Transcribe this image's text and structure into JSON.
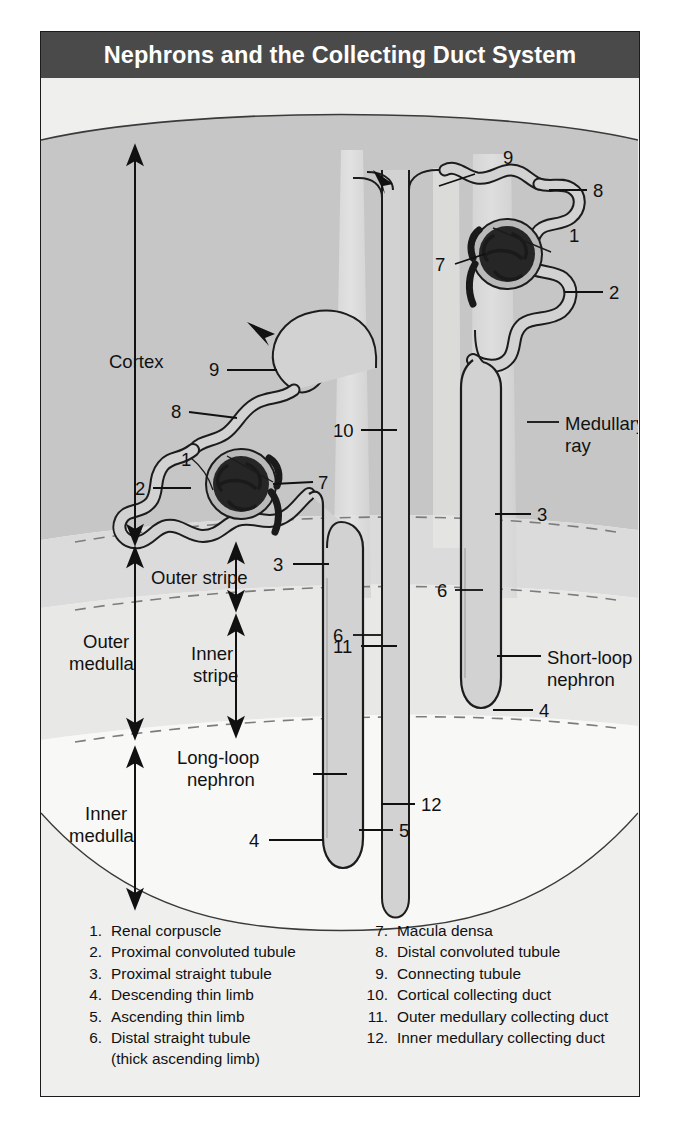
{
  "title": "Nephrons and the Collecting Duct System",
  "zones": {
    "cortex": "Cortex",
    "outer_medulla_l1": "Outer",
    "outer_medulla_l2": "medulla",
    "inner_medulla_l1": "Inner",
    "inner_medulla_l2": "medulla",
    "outer_stripe": "Outer stripe",
    "inner_stripe_l1": "Inner",
    "inner_stripe_l2": "stripe"
  },
  "callouts": {
    "medullary_ray_l1": "Medullary",
    "medullary_ray_l2": "ray",
    "short_loop_l1": "Short-loop",
    "short_loop_l2": "nephron",
    "long_loop_l1": "Long-loop",
    "long_loop_l2": "nephron"
  },
  "numbers": {
    "left_nephron": {
      "n1": "1",
      "n2": "2",
      "n3": "3",
      "n4": "4",
      "n5": "5",
      "n6": "6",
      "n8": "8",
      "n9": "9"
    },
    "right_nephron": {
      "n1": "1",
      "n2": "2",
      "n3": "3",
      "n4": "4",
      "n6": "6",
      "n7": "7",
      "n8": "8",
      "n9": "9"
    },
    "left_glomerulus_7": "7",
    "duct": {
      "n10": "10",
      "n11": "11",
      "n12": "12"
    }
  },
  "legend": {
    "left": [
      {
        "num": "1.",
        "text": "Renal corpuscle"
      },
      {
        "num": "2.",
        "text": "Proximal convoluted tubule"
      },
      {
        "num": "3.",
        "text": "Proximal straight tubule"
      },
      {
        "num": "4.",
        "text": "Descending thin limb"
      },
      {
        "num": "5.",
        "text": "Ascending thin limb"
      },
      {
        "num": "6.",
        "text": "Distal straight tubule"
      }
    ],
    "left_sub": "(thick ascending limb)",
    "right": [
      {
        "num": "7.",
        "text": "Macula densa"
      },
      {
        "num": "8.",
        "text": "Distal convoluted tubule"
      },
      {
        "num": "9.",
        "text": "Connecting tubule"
      },
      {
        "num": "10.",
        "text": "Cortical collecting duct"
      },
      {
        "num": "11.",
        "text": "Outer medullary collecting duct"
      },
      {
        "num": "12.",
        "text": "Inner medullary collecting duct"
      }
    ]
  },
  "colors": {
    "title_bar": "#4a4a4a",
    "page_bg": "#efefee",
    "cortex": "#c6c6c6",
    "outer_stripe": "#dcdcdc",
    "inner_stripe": "#e6e6e6",
    "inner_medulla": "#f7f7f6",
    "medullary_ray": "#e2e2e2",
    "tubule_fill": "#d2d2d2",
    "glomerulus": "#2a2a2a",
    "outline": "#1c1c1c"
  }
}
